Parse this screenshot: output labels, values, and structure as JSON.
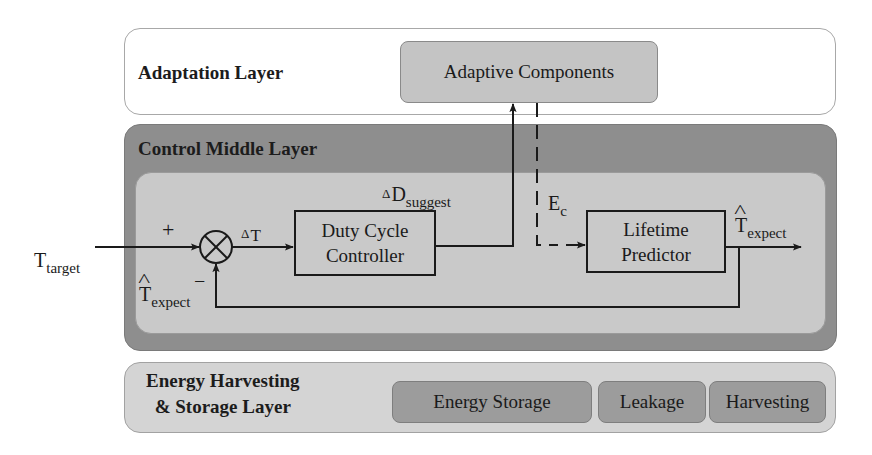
{
  "layers": {
    "adaptation": {
      "title": "Adaptation Layer",
      "components": [
        {
          "label": "Adaptive Components"
        }
      ]
    },
    "control": {
      "title": "Control Middle Layer",
      "blocks": {
        "duty_cycle_controller": {
          "line1": "Duty Cycle",
          "line2": "Controller"
        },
        "lifetime_predictor": {
          "line1": "Lifetime",
          "line2": "Predictor"
        }
      },
      "summing_junction": {
        "plus": "+",
        "minus": "−"
      }
    },
    "energy": {
      "title_line1": "Energy Harvesting",
      "title_line2": "& Storage Layer",
      "components": [
        {
          "label": "Energy Storage"
        },
        {
          "label": "Leakage"
        },
        {
          "label": "Harvesting"
        }
      ]
    }
  },
  "signals": {
    "t_target": {
      "base": "T",
      "sub": "target"
    },
    "delta_t": {
      "delta": "Δ",
      "base": "T"
    },
    "delta_d_suggest": {
      "delta": "Δ",
      "base": "D",
      "sub": "suggest"
    },
    "e_c": {
      "base": "E",
      "sub": "c"
    },
    "t_expect_out": {
      "base": "T",
      "sub": "expect"
    },
    "t_expect_feedback": {
      "base": "T",
      "sub": "expect"
    }
  },
  "colors": {
    "adaptation_bg": "#ffffff",
    "control_outer_bg": "#8e8e8e",
    "control_inner_bg": "#c9c9c9",
    "energy_bg": "#d4d4d4",
    "adaptive_component_bg": "#c4c4c4",
    "energy_component_bg": "#9c9c9c",
    "line": "#1a1a1a"
  }
}
